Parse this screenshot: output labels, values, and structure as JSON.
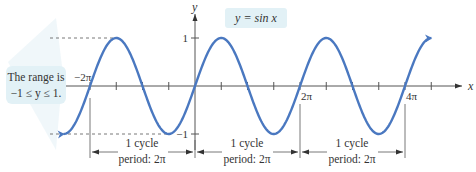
{
  "function": {
    "label": "y = sin x",
    "x_range_periods": [
      -2.5,
      4.5
    ],
    "amplitude": 1,
    "period": "2π",
    "curve_color": "#4a78c0"
  },
  "axes": {
    "x_label": "x",
    "y_label": "y",
    "y_ticks": [
      {
        "value": 1,
        "label": "1"
      },
      {
        "value": -1,
        "label": "−1"
      }
    ],
    "x_tick_labels": [
      {
        "value": -2,
        "label": "−2π"
      },
      {
        "value": 2,
        "label": "2π"
      },
      {
        "value": 4,
        "label": "4π"
      }
    ]
  },
  "callout": {
    "line1": "The range is",
    "line2": "−1 ≤ y ≤ 1.",
    "bg_color": "#e2f1f6"
  },
  "label_bg_color": "#e2f1f6",
  "cycles": [
    {
      "line1": "1 cycle",
      "line2": "period: 2π"
    },
    {
      "line1": "1 cycle",
      "line2": "period: 2π"
    },
    {
      "line1": "1 cycle",
      "line2": "period: 2π"
    }
  ]
}
